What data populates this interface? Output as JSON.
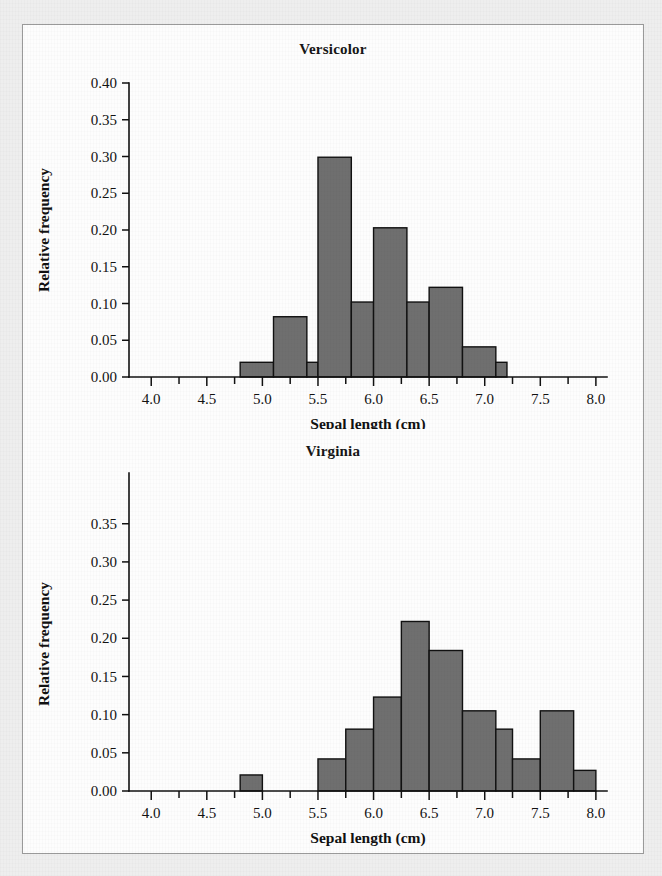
{
  "figure": {
    "background_color": "#eeeeee",
    "panel_color": "#fdfdfd",
    "panel_border_color": "#9a9a9a",
    "bar_fill_color": "#6f6f6f",
    "bar_edge_color": "#111111",
    "axis_color": "#111111"
  },
  "chart_data": [
    {
      "type": "bar",
      "id": "versicolor",
      "title": "Versicolor",
      "xlabel": "Sepal length (cm)",
      "ylabel": "Relative frequency",
      "xlim": [
        3.8,
        8.1
      ],
      "ylim": [
        0.0,
        0.4
      ],
      "grid": false,
      "legend": "none",
      "bin_width": 0.3,
      "xticks": [
        4.0,
        4.5,
        5.0,
        5.5,
        6.0,
        6.5,
        7.0,
        7.5,
        8.0
      ],
      "xtick_labels": [
        "4.0",
        "4.5",
        "5.0",
        "5.5",
        "6.0",
        "6.5",
        "7.0",
        "7.5",
        "8.0"
      ],
      "xminor_tick_step": 0.25,
      "yticks": [
        0.0,
        0.05,
        0.1,
        0.15,
        0.2,
        0.25,
        0.3,
        0.35,
        0.4
      ],
      "ytick_labels": [
        "0.00",
        "0.05",
        "0.10",
        "0.15",
        "0.20",
        "0.25",
        "0.30",
        "0.35",
        "0.40"
      ],
      "bins": [
        {
          "left": 4.8,
          "right": 5.1,
          "value": 0.02
        },
        {
          "left": 5.1,
          "right": 5.4,
          "value": 0.082
        },
        {
          "left": 5.4,
          "right": 5.5,
          "value": 0.02
        },
        {
          "left": 5.5,
          "right": 5.8,
          "value": 0.299
        },
        {
          "left": 5.8,
          "right": 6.0,
          "value": 0.102
        },
        {
          "left": 6.0,
          "right": 6.3,
          "value": 0.203
        },
        {
          "left": 6.3,
          "right": 6.5,
          "value": 0.102
        },
        {
          "left": 6.5,
          "right": 6.8,
          "value": 0.122
        },
        {
          "left": 6.8,
          "right": 7.1,
          "value": 0.041
        },
        {
          "left": 7.1,
          "right": 7.2,
          "value": 0.02
        }
      ],
      "categories": [
        "4.8-5.1",
        "5.1-5.4",
        "5.4-5.5",
        "5.5-5.8",
        "5.8-6.0",
        "6.0-6.3",
        "6.3-6.5",
        "6.5-6.8",
        "6.8-7.1",
        "7.1-7.2"
      ],
      "values": [
        0.02,
        0.082,
        0.02,
        0.299,
        0.102,
        0.203,
        0.102,
        0.122,
        0.041,
        0.02
      ]
    },
    {
      "type": "bar",
      "id": "virginia",
      "title": "Virginia",
      "xlabel": "Sepal length (cm)",
      "ylabel": "Relative frequency",
      "xlim": [
        3.8,
        8.1
      ],
      "ylim": [
        0.0,
        0.385
      ],
      "grid": false,
      "legend": "none",
      "bin_width": 0.3,
      "xticks": [
        4.0,
        4.5,
        5.0,
        5.5,
        6.0,
        6.5,
        7.0,
        7.5,
        8.0
      ],
      "xtick_labels": [
        "4.0",
        "4.5",
        "5.0",
        "5.5",
        "6.0",
        "6.5",
        "7.0",
        "7.5",
        "8.0"
      ],
      "xminor_tick_step": 0.25,
      "yticks": [
        0.0,
        0.05,
        0.1,
        0.15,
        0.2,
        0.25,
        0.3,
        0.35
      ],
      "ytick_labels": [
        "0.00",
        "0.05",
        "0.10",
        "0.15",
        "0.20",
        "0.25",
        "0.30",
        "0.35"
      ],
      "bins": [
        {
          "left": 4.8,
          "right": 5.0,
          "value": 0.021
        },
        {
          "left": 5.5,
          "right": 5.75,
          "value": 0.042
        },
        {
          "left": 5.75,
          "right": 6.0,
          "value": 0.081
        },
        {
          "left": 6.0,
          "right": 6.25,
          "value": 0.123
        },
        {
          "left": 6.25,
          "right": 6.5,
          "value": 0.222
        },
        {
          "left": 6.5,
          "right": 6.8,
          "value": 0.184
        },
        {
          "left": 6.8,
          "right": 7.1,
          "value": 0.105
        },
        {
          "left": 7.1,
          "right": 7.25,
          "value": 0.081
        },
        {
          "left": 7.25,
          "right": 7.5,
          "value": 0.042
        },
        {
          "left": 7.5,
          "right": 7.8,
          "value": 0.105
        },
        {
          "left": 7.8,
          "right": 8.0,
          "value": 0.027
        }
      ],
      "categories": [
        "4.8-5.0",
        "5.5-5.75",
        "5.75-6.0",
        "6.0-6.25",
        "6.25-6.5",
        "6.5-6.8",
        "6.8-7.1",
        "7.1-7.25",
        "7.25-7.5",
        "7.5-7.8",
        "7.8-8.0"
      ],
      "values": [
        0.021,
        0.042,
        0.081,
        0.123,
        0.222,
        0.184,
        0.105,
        0.081,
        0.042,
        0.105,
        0.027
      ]
    }
  ]
}
